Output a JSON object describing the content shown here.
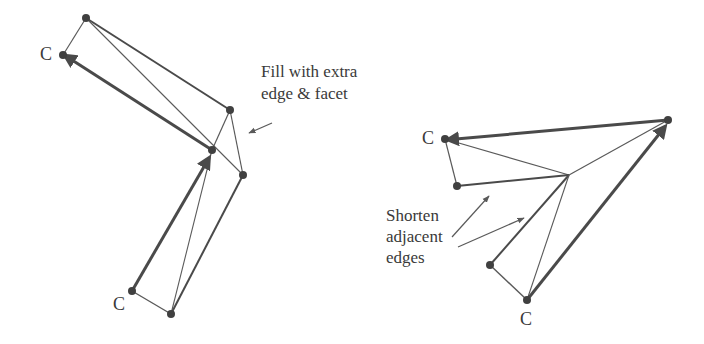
{
  "left_figure": {
    "annotation": [
      "Fill with extra",
      "edge & facet"
    ],
    "corner_labels": [
      "C",
      "C"
    ],
    "vertices": {
      "top": [
        86,
        18
      ],
      "c_upper": [
        63,
        55
      ],
      "right": [
        230,
        110
      ],
      "mid": [
        212,
        150
      ],
      "lower_right": [
        243,
        175
      ],
      "c_lower": [
        132,
        291
      ],
      "bottom": [
        171,
        314
      ]
    }
  },
  "right_figure": {
    "annotation": [
      "Shorten",
      "adjacent",
      "edges"
    ],
    "corner_labels": [
      "C",
      "C"
    ],
    "vertices": {
      "c_left": [
        445,
        139
      ],
      "top_right": [
        668,
        120
      ],
      "hub": [
        569,
        175
      ],
      "left_short": [
        457,
        186
      ],
      "lower_short": [
        490,
        265
      ],
      "c_bottom": [
        527,
        300
      ]
    }
  },
  "colors": {
    "line": "#5a5a5a",
    "thick_line": "#4a4a4a",
    "vertex": "#404040",
    "text": "#3a3a3a"
  }
}
